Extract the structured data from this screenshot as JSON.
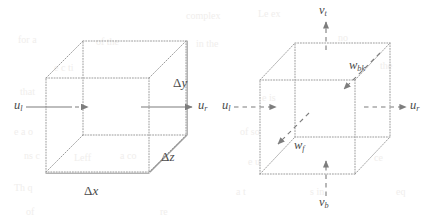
{
  "figure": {
    "background_color": "#ffffff",
    "line_color": "#8a8a8a",
    "label_color": "#4a4a4a",
    "ghost_color": "#f0eeec",
    "panels": [
      {
        "id": "left",
        "name": "control-volume-dimensions",
        "caption": "",
        "cube": {
          "style": "wireframe-dotted",
          "front_face": "lower-left",
          "back_face": "upper-right"
        },
        "labels": [
          {
            "id": "u-left",
            "name": "velocity-u-left",
            "base": "u",
            "sub": "l",
            "x": 14,
            "y": 99,
            "kind": "velocity"
          },
          {
            "id": "u-right",
            "name": "velocity-u-right",
            "base": "u",
            "sub": "r",
            "x": 198,
            "y": 99,
            "kind": "velocity"
          },
          {
            "id": "delta-y",
            "name": "dimension-delta-y",
            "base": "Δ",
            "var": "y",
            "x": 173,
            "y": 76,
            "kind": "dimension"
          },
          {
            "id": "delta-z",
            "name": "dimension-delta-z",
            "base": "Δ",
            "var": "z",
            "x": 161,
            "y": 150,
            "kind": "dimension"
          },
          {
            "id": "delta-x",
            "name": "dimension-delta-x",
            "base": "Δ",
            "var": "x",
            "x": 84,
            "y": 184,
            "kind": "dimension"
          }
        ],
        "arrows": [
          {
            "id": "arrow-u-left",
            "name": "flux-arrow-u-left",
            "direction": "right",
            "style": "solid-then-dashed"
          },
          {
            "id": "arrow-u-right",
            "name": "flux-arrow-u-right",
            "direction": "right",
            "style": "solid"
          }
        ]
      },
      {
        "id": "right",
        "name": "control-volume-face-velocities",
        "caption": "",
        "cube": {
          "style": "wireframe-dotted",
          "front_face": "lower-left",
          "back_face": "upper-right"
        },
        "labels": [
          {
            "id": "v-top",
            "name": "velocity-v-top",
            "base": "v",
            "sub": "t",
            "x": 319,
            "y": 4,
            "kind": "velocity"
          },
          {
            "id": "v-bottom",
            "name": "velocity-v-bottom",
            "base": "v",
            "sub": "b",
            "x": 319,
            "y": 196,
            "kind": "velocity"
          },
          {
            "id": "u-left",
            "name": "velocity-u-left",
            "base": "u",
            "sub": "l",
            "x": 222,
            "y": 99,
            "kind": "velocity"
          },
          {
            "id": "u-right",
            "name": "velocity-u-right",
            "base": "u",
            "sub": "r",
            "x": 410,
            "y": 99,
            "kind": "velocity"
          },
          {
            "id": "w-back",
            "name": "velocity-w-back",
            "base": "w",
            "sub": "bk",
            "x": 349,
            "y": 59,
            "kind": "velocity"
          },
          {
            "id": "w-front",
            "name": "velocity-w-front",
            "base": "w",
            "sub": "f",
            "x": 294,
            "y": 139,
            "kind": "velocity"
          }
        ],
        "arrows": [
          {
            "id": "arrow-v-top",
            "name": "flux-arrow-v-top",
            "direction": "up",
            "style": "dashed"
          },
          {
            "id": "arrow-v-bottom",
            "name": "flux-arrow-v-bottom",
            "direction": "up",
            "style": "dashed"
          },
          {
            "id": "arrow-u-left",
            "name": "flux-arrow-u-left",
            "direction": "right",
            "style": "dashed"
          },
          {
            "id": "arrow-u-right",
            "name": "flux-arrow-u-right",
            "direction": "right",
            "style": "dashed"
          },
          {
            "id": "arrow-w-back",
            "name": "flux-arrow-w-back",
            "direction": "down-left",
            "style": "dashed"
          },
          {
            "id": "arrow-w-front",
            "name": "flux-arrow-w-front",
            "direction": "up-right",
            "style": "dashed"
          }
        ]
      }
    ],
    "ghost_text": [
      {
        "t": "complex",
        "x": 186,
        "y": 10
      },
      {
        "t": "Le  ex",
        "x": 258,
        "y": 8
      },
      {
        "t": "for  a",
        "x": 18,
        "y": 34
      },
      {
        "t": "of  the",
        "x": 96,
        "y": 36
      },
      {
        "t": "in the",
        "x": 196,
        "y": 38
      },
      {
        "t": "no",
        "x": 338,
        "y": 32
      },
      {
        "t": "e c ti",
        "x": 54,
        "y": 62
      },
      {
        "t": "the",
        "x": 380,
        "y": 60
      },
      {
        "t": "that",
        "x": 20,
        "y": 86
      },
      {
        "t": "e  is",
        "x": 262,
        "y": 92
      },
      {
        "t": "e  a  o",
        "x": 14,
        "y": 126
      },
      {
        "t": "of  so",
        "x": 240,
        "y": 126
      },
      {
        "t": "Leff",
        "x": 74,
        "y": 152
      },
      {
        "t": "ns  c",
        "x": 24,
        "y": 150
      },
      {
        "t": "a  co",
        "x": 120,
        "y": 150
      },
      {
        "t": "e  u",
        "x": 248,
        "y": 156
      },
      {
        "t": "ce",
        "x": 374,
        "y": 152
      },
      {
        "t": "Th   q",
        "x": 14,
        "y": 182
      },
      {
        "t": "a  t",
        "x": 236,
        "y": 186
      },
      {
        "t": "s  in",
        "x": 310,
        "y": 186
      },
      {
        "t": "eq",
        "x": 396,
        "y": 186
      },
      {
        "t": "of",
        "x": 26,
        "y": 206
      },
      {
        "t": "re",
        "x": 160,
        "y": 206
      }
    ]
  }
}
